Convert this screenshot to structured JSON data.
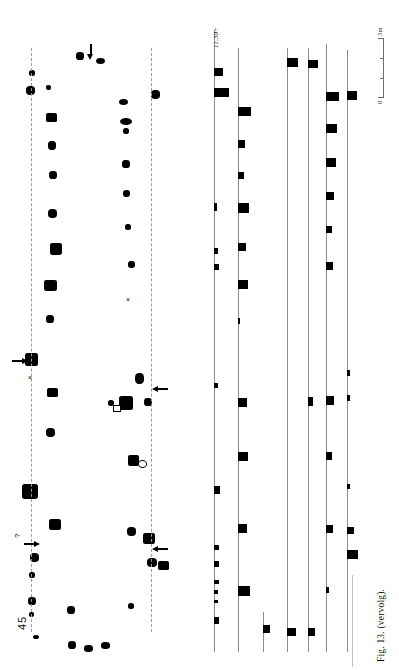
{
  "page": {
    "running_head": "",
    "figure_caption": "Fig. 13. (vervolg).",
    "plan_number": "45"
  },
  "plan": {
    "name": "ground-plan",
    "axes": [
      {
        "id": "axis-left",
        "x": 31,
        "y1": 48,
        "y2": 632,
        "style": "dashed"
      },
      {
        "id": "axis-right",
        "x": 151,
        "y1": 48,
        "y2": 632,
        "style": "dashed"
      }
    ],
    "postholes": [
      {
        "x": 29,
        "y": 70,
        "w": 6,
        "h": 6
      },
      {
        "x": 26,
        "y": 86,
        "w": 9,
        "h": 9
      },
      {
        "x": 46,
        "y": 85,
        "w": 5,
        "h": 5
      },
      {
        "x": 46,
        "y": 113,
        "w": 11,
        "h": 9
      },
      {
        "x": 48,
        "y": 141,
        "w": 8,
        "h": 9
      },
      {
        "x": 49,
        "y": 171,
        "w": 8,
        "h": 8
      },
      {
        "x": 48,
        "y": 209,
        "w": 9,
        "h": 9
      },
      {
        "x": 50,
        "y": 243,
        "w": 12,
        "h": 12
      },
      {
        "x": 44,
        "y": 280,
        "w": 13,
        "h": 11
      },
      {
        "x": 46,
        "y": 315,
        "w": 8,
        "h": 8
      },
      {
        "x": 25,
        "y": 353,
        "w": 13,
        "h": 13
      },
      {
        "x": 47,
        "y": 388,
        "w": 11,
        "h": 9
      },
      {
        "x": 46,
        "y": 428,
        "w": 9,
        "h": 9
      },
      {
        "x": 22,
        "y": 484,
        "w": 16,
        "h": 15
      },
      {
        "x": 49,
        "y": 519,
        "w": 12,
        "h": 11
      },
      {
        "x": 30,
        "y": 553,
        "w": 9,
        "h": 9
      },
      {
        "x": 29,
        "y": 572,
        "w": 6,
        "h": 6
      },
      {
        "x": 28,
        "y": 597,
        "w": 8,
        "h": 8
      },
      {
        "x": 29,
        "y": 612,
        "w": 5,
        "h": 5
      },
      {
        "x": 33,
        "y": 635,
        "w": 6,
        "h": 4
      },
      {
        "x": 67,
        "y": 606,
        "w": 8,
        "h": 8
      },
      {
        "x": 68,
        "y": 641,
        "w": 8,
        "h": 8
      },
      {
        "x": 84,
        "y": 645,
        "w": 9,
        "h": 7
      },
      {
        "x": 101,
        "y": 642,
        "w": 9,
        "h": 7
      },
      {
        "x": 76,
        "y": 52,
        "w": 8,
        "h": 8
      },
      {
        "x": 96,
        "y": 58,
        "w": 9,
        "h": 6
      },
      {
        "x": 120,
        "y": 118,
        "w": 12,
        "h": 7
      },
      {
        "x": 123,
        "y": 128,
        "w": 6,
        "h": 6
      },
      {
        "x": 122,
        "y": 160,
        "w": 8,
        "h": 8
      },
      {
        "x": 123,
        "y": 190,
        "w": 7,
        "h": 7
      },
      {
        "x": 125,
        "y": 224,
        "w": 6,
        "h": 6
      },
      {
        "x": 128,
        "y": 261,
        "w": 7,
        "h": 7
      },
      {
        "x": 135,
        "y": 373,
        "w": 9,
        "h": 11
      },
      {
        "x": 108,
        "y": 400,
        "w": 6,
        "h": 6
      },
      {
        "x": 119,
        "y": 396,
        "w": 14,
        "h": 14
      },
      {
        "x": 144,
        "y": 398,
        "w": 8,
        "h": 8
      },
      {
        "x": 128,
        "y": 455,
        "w": 11,
        "h": 11
      },
      {
        "x": 127,
        "y": 527,
        "w": 9,
        "h": 9
      },
      {
        "x": 143,
        "y": 533,
        "w": 12,
        "h": 11
      },
      {
        "x": 147,
        "y": 558,
        "w": 10,
        "h": 9
      },
      {
        "x": 128,
        "y": 603,
        "w": 6,
        "h": 6
      },
      {
        "x": 119,
        "y": 99,
        "w": 9,
        "h": 6
      },
      {
        "x": 151,
        "y": 90,
        "w": 9,
        "h": 9
      },
      {
        "x": 158,
        "y": 561,
        "w": 11,
        "h": 9
      }
    ],
    "markers": [
      {
        "type": "x-mark",
        "label": "×",
        "x": 126,
        "y": 296
      },
      {
        "type": "x-mark",
        "label": "×",
        "x": 28,
        "y": 374
      },
      {
        "type": "open-circle",
        "x": 138,
        "y": 460
      },
      {
        "type": "open-square",
        "x": 113,
        "y": 405
      },
      {
        "type": "question",
        "label": "?",
        "x": 14,
        "y": 538
      }
    ],
    "arrows": [
      {
        "dir": "down",
        "x": 88,
        "y": 44
      },
      {
        "dir": "right",
        "x": 12,
        "y": 358
      },
      {
        "dir": "left",
        "x": 152,
        "y": 386
      },
      {
        "dir": "right",
        "x": 24,
        "y": 541
      },
      {
        "dir": "left",
        "x": 152,
        "y": 546
      }
    ]
  },
  "sections": {
    "name": "section-profiles",
    "depth_label": "11.30+",
    "lines": [
      {
        "id": "profile-1",
        "x": 14,
        "y1": 30,
        "y2": 652
      },
      {
        "id": "profile-2",
        "x": 38,
        "y1": 48,
        "y2": 652
      },
      {
        "id": "profile-3",
        "x": 63,
        "y1": 612,
        "y2": 652
      },
      {
        "id": "profile-4",
        "x": 87,
        "y1": 48,
        "y2": 652
      },
      {
        "id": "profile-5",
        "x": 108,
        "y1": 48,
        "y2": 652
      },
      {
        "id": "profile-6",
        "x": 126,
        "y1": 44,
        "y2": 652
      },
      {
        "id": "profile-7",
        "x": 147,
        "y1": 50,
        "y2": 652
      }
    ],
    "blocks": [
      {
        "line": 1,
        "y": 68,
        "w": 9,
        "h": 8
      },
      {
        "line": 1,
        "y": 88,
        "w": 15,
        "h": 9
      },
      {
        "line": 1,
        "y": 203,
        "w": 3,
        "h": 8
      },
      {
        "line": 1,
        "y": 248,
        "w": 4,
        "h": 6
      },
      {
        "line": 1,
        "y": 264,
        "w": 5,
        "h": 6
      },
      {
        "line": 1,
        "y": 383,
        "w": 4,
        "h": 5
      },
      {
        "line": 1,
        "y": 486,
        "w": 6,
        "h": 8
      },
      {
        "line": 1,
        "y": 545,
        "w": 5,
        "h": 5
      },
      {
        "line": 1,
        "y": 561,
        "w": 5,
        "h": 6
      },
      {
        "line": 1,
        "y": 580,
        "w": 5,
        "h": 4
      },
      {
        "line": 1,
        "y": 590,
        "w": 4,
        "h": 4
      },
      {
        "line": 1,
        "y": 600,
        "w": 4,
        "h": 3
      },
      {
        "line": 1,
        "y": 617,
        "w": 5,
        "h": 7
      },
      {
        "line": 2,
        "y": 107,
        "w": 13,
        "h": 9
      },
      {
        "line": 2,
        "y": 140,
        "w": 7,
        "h": 8
      },
      {
        "line": 2,
        "y": 172,
        "w": 6,
        "h": 7
      },
      {
        "line": 2,
        "y": 203,
        "w": 11,
        "h": 10
      },
      {
        "line": 2,
        "y": 243,
        "w": 8,
        "h": 8
      },
      {
        "line": 2,
        "y": 280,
        "w": 10,
        "h": 9
      },
      {
        "line": 2,
        "y": 318,
        "w": 2,
        "h": 6
      },
      {
        "line": 2,
        "y": 398,
        "w": 9,
        "h": 9
      },
      {
        "line": 2,
        "y": 452,
        "w": 10,
        "h": 9
      },
      {
        "line": 2,
        "y": 524,
        "w": 9,
        "h": 9
      },
      {
        "line": 2,
        "y": 586,
        "w": 12,
        "h": 10
      },
      {
        "line": 3,
        "y": 625,
        "w": 7,
        "h": 8
      },
      {
        "line": 4,
        "y": 58,
        "w": 11,
        "h": 9
      },
      {
        "line": 4,
        "y": 628,
        "w": 9,
        "h": 8
      },
      {
        "line": 5,
        "y": 60,
        "w": 10,
        "h": 8
      },
      {
        "line": 5,
        "y": 397,
        "w": 5,
        "h": 9
      },
      {
        "line": 5,
        "y": 628,
        "w": 7,
        "h": 8
      },
      {
        "line": 6,
        "y": 92,
        "w": 13,
        "h": 9
      },
      {
        "line": 6,
        "y": 124,
        "w": 11,
        "h": 9
      },
      {
        "line": 6,
        "y": 158,
        "w": 10,
        "h": 9
      },
      {
        "line": 6,
        "y": 192,
        "w": 8,
        "h": 8
      },
      {
        "line": 6,
        "y": 226,
        "w": 6,
        "h": 7
      },
      {
        "line": 6,
        "y": 262,
        "w": 7,
        "h": 8
      },
      {
        "line": 6,
        "y": 396,
        "w": 8,
        "h": 9
      },
      {
        "line": 6,
        "y": 452,
        "w": 6,
        "h": 8
      },
      {
        "line": 6,
        "y": 525,
        "w": 7,
        "h": 8
      },
      {
        "line": 6,
        "y": 587,
        "w": 3,
        "h": 6
      },
      {
        "line": 7,
        "y": 91,
        "w": 10,
        "h": 9
      },
      {
        "line": 7,
        "y": 370,
        "w": 3,
        "h": 6
      },
      {
        "line": 7,
        "y": 395,
        "w": 3,
        "h": 6
      },
      {
        "line": 7,
        "y": 484,
        "w": 3,
        "h": 5
      },
      {
        "line": 7,
        "y": 527,
        "w": 7,
        "h": 7
      },
      {
        "line": 7,
        "y": 550,
        "w": 11,
        "h": 9
      }
    ]
  },
  "scale": {
    "name": "scale-bar",
    "top_label": "3m",
    "bottom_label": "0",
    "ticks": 3
  }
}
